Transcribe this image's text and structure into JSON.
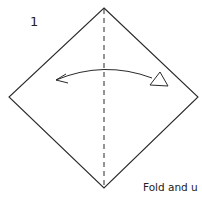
{
  "diagram": {
    "step_number": "1",
    "caption": "Fold and u",
    "colors": {
      "line": "#2a2a2a",
      "background": "#ffffff"
    },
    "square": {
      "shape": "diamond",
      "vertices": {
        "top": [
          104,
          8
        ],
        "right": [
          198,
          97
        ],
        "bottom": [
          104,
          188
        ],
        "left": [
          9,
          97
        ]
      }
    },
    "fold_line": {
      "style": "dashed",
      "x": 104,
      "y1": 8,
      "y2": 188
    },
    "arrow": {
      "type": "fold-and-unfold",
      "from": [
        55,
        80
      ],
      "to": [
        155,
        80
      ]
    }
  }
}
